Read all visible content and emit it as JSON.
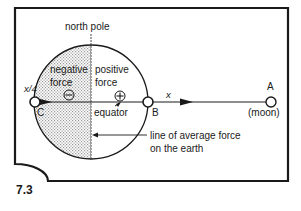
{
  "figure": {
    "number": "7.3",
    "labels": {
      "north_pole": "north pole",
      "negative_force_line1": "negative",
      "negative_force_line2": "force",
      "positive_force_line1": "positive",
      "positive_force_line2": "force",
      "negative_symbol": "⊖",
      "positive_symbol": "⊕",
      "equator": "equator",
      "line_avg_line1": "line of average force",
      "line_avg_line2": "on the earth",
      "point_a": "A",
      "point_b": "B",
      "point_c": "C",
      "moon": "(moon)",
      "x_label": "x",
      "x4_label": "x/4"
    },
    "colors": {
      "ink": "#1a1a1a",
      "background": "#ffffff",
      "shading": "#bdbdbd"
    }
  }
}
